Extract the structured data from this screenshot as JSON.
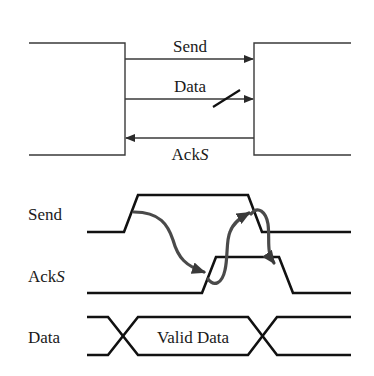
{
  "block_diagram": {
    "signals": [
      {
        "label": "Send",
        "direction": "left-to-right"
      },
      {
        "label": "Data",
        "direction": "left-to-right",
        "bus": true
      },
      {
        "label_main": "Ack",
        "label_italic": "S",
        "direction": "right-to-left"
      }
    ]
  },
  "timing_diagram": {
    "rows": [
      {
        "label": "Send"
      },
      {
        "label_main": "Ack",
        "label_italic": "S"
      },
      {
        "label": "Data",
        "bus_text": "Valid Data"
      }
    ]
  },
  "colors": {
    "line": "#111111",
    "thin_line": "#3a3a3a",
    "causal_arrow": "#4a4a4a",
    "background": "#ffffff"
  }
}
